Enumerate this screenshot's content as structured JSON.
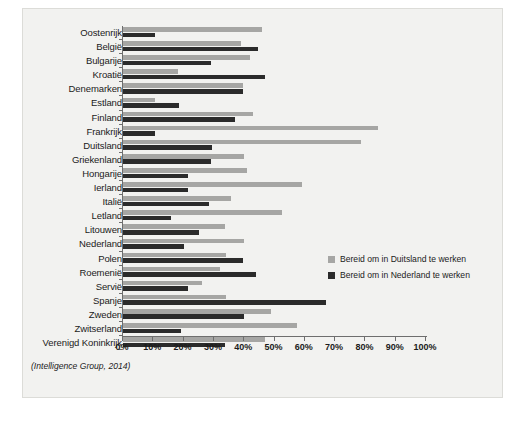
{
  "chart_data": {
    "type": "bar",
    "orientation": "horizontal",
    "title": "",
    "xlabel": "",
    "ylabel": "",
    "xlim": [
      0,
      100
    ],
    "xticks": [
      "0%",
      "10%",
      "20%",
      "30%",
      "40%",
      "50%",
      "60%",
      "70%",
      "80%",
      "90%",
      "100%"
    ],
    "xtick_values": [
      0,
      10,
      20,
      30,
      40,
      50,
      60,
      70,
      80,
      90,
      100
    ],
    "grid": false,
    "legend_position": "right",
    "categories": [
      "Oostenrijk",
      "België",
      "Bulgarije",
      "Kroatië",
      "Denemarken",
      "Estland",
      "Finland",
      "Frankrijk",
      "Duitsland",
      "Griekenland",
      "Hongarije",
      "Ierland",
      "Italië",
      "Letland",
      "Litouwen",
      "Nederland",
      "Polen",
      "Roemenië",
      "Servië",
      "Spanje",
      "Zweden",
      "Zwitserland",
      "Verenigd Koninkrijk"
    ],
    "series": [
      {
        "name": "Bereid om in Duitsland te werken",
        "color": "#a6a6a4",
        "values": [
          46,
          39,
          42,
          18,
          39.5,
          10.5,
          43,
          84,
          78.5,
          40,
          41,
          59,
          35.5,
          52.5,
          33.5,
          40,
          34,
          32,
          26,
          34,
          49,
          57.5,
          47
        ]
      },
      {
        "name": "Bereid om in Nederland te werken",
        "color": "#2b2b2b",
        "values": [
          10.5,
          44.5,
          29,
          47,
          39.5,
          18.5,
          37,
          10.5,
          29.5,
          29,
          21.5,
          21.5,
          28.5,
          16,
          25,
          20,
          39.5,
          44,
          21.5,
          67,
          40,
          19,
          33.5
        ]
      }
    ],
    "caption": "(Intelligence Group, 2014)"
  }
}
